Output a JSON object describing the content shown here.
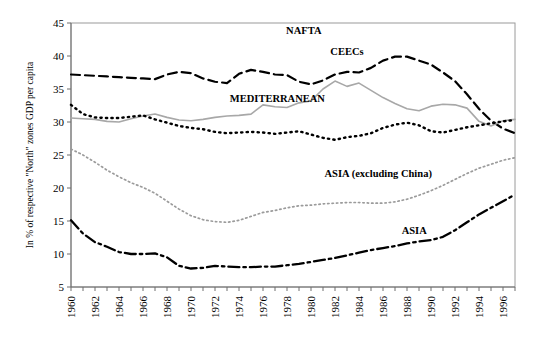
{
  "chart_data": {
    "type": "line",
    "title": "",
    "subtitle": "",
    "xlabel": "",
    "ylabel": "In % of respective \"North\" zones GDP per capita",
    "xlim": [
      1960,
      1997
    ],
    "ylim": [
      5,
      45
    ],
    "ytick_step": 5,
    "xtick_step": 1,
    "xtick_label_step": 2,
    "grid": false,
    "legend": "inline-annotations",
    "x": [
      1960,
      1961,
      1962,
      1963,
      1964,
      1965,
      1966,
      1967,
      1968,
      1969,
      1970,
      1971,
      1972,
      1973,
      1974,
      1975,
      1976,
      1977,
      1978,
      1979,
      1980,
      1981,
      1982,
      1983,
      1984,
      1985,
      1986,
      1987,
      1988,
      1989,
      1990,
      1991,
      1992,
      1993,
      1994,
      1995,
      1996,
      1997
    ],
    "ytick_labels": [
      "5",
      "10",
      "15",
      "20",
      "25",
      "30",
      "35",
      "40",
      "45"
    ],
    "xtick_labels": [
      "1960",
      "1962",
      "1964",
      "1966",
      "1968",
      "1970",
      "1972",
      "1974",
      "1976",
      "1978",
      "1980",
      "1982",
      "1984",
      "1986",
      "1988",
      "1990",
      "1992",
      "1994",
      "1996"
    ],
    "series": [
      {
        "name": "CEECs",
        "style": "dashed",
        "color": "#000000",
        "width": 2.2,
        "dash": "9,5",
        "label_x": 1983.0,
        "label_y": 40.2,
        "values": [
          37.2,
          37.1,
          37.0,
          36.9,
          36.8,
          36.7,
          36.6,
          36.5,
          37.2,
          37.6,
          37.4,
          36.6,
          36.1,
          35.9,
          37.3,
          37.9,
          37.6,
          37.2,
          37.1,
          36.1,
          35.7,
          36.3,
          37.2,
          37.6,
          37.5,
          38.2,
          39.3,
          39.9,
          39.9,
          39.3,
          38.7,
          37.5,
          36.2,
          34.2,
          32.0,
          30.2,
          29.0,
          28.3
        ]
      },
      {
        "name": "NAFTA",
        "style": "solid",
        "color": "#a8a8a8",
        "width": 1.6,
        "dash": "",
        "label_x": 1979.4,
        "label_y": 43.4,
        "values": [
          30.6,
          30.5,
          30.4,
          30.1,
          30.0,
          30.5,
          30.9,
          31.2,
          30.7,
          30.3,
          30.2,
          30.4,
          30.7,
          30.9,
          31.0,
          31.2,
          32.6,
          32.3,
          32.2,
          32.9,
          33.2,
          35.0,
          36.2,
          35.4,
          35.9,
          34.8,
          33.7,
          32.8,
          32.0,
          31.7,
          32.4,
          32.7,
          32.6,
          32.1,
          30.1,
          29.4,
          30.2,
          30.4
        ]
      },
      {
        "name": "MEDITERRANEAN",
        "style": "dotted",
        "color": "#000000",
        "width": 2.4,
        "dash": "1.3,4.2",
        "label_x": 1977.2,
        "label_y": 33.1,
        "values": [
          32.6,
          31.2,
          30.7,
          30.6,
          30.6,
          30.8,
          31.0,
          30.4,
          29.9,
          29.4,
          29.1,
          28.9,
          28.5,
          28.3,
          28.4,
          28.5,
          28.4,
          28.2,
          28.4,
          28.6,
          28.1,
          27.6,
          27.3,
          27.7,
          27.9,
          28.3,
          29.1,
          29.6,
          29.9,
          29.5,
          28.6,
          28.4,
          28.8,
          29.2,
          29.5,
          29.8,
          30.1,
          30.3
        ]
      },
      {
        "name": "ASIA (excluding China)",
        "style": "dotted",
        "color": "#9b9b9b",
        "width": 1.7,
        "dash": "1.4,3.0",
        "label_x": 1985.6,
        "label_y": 21.7,
        "values": [
          25.9,
          25.0,
          23.9,
          22.7,
          21.7,
          20.8,
          20.1,
          19.2,
          18.0,
          16.8,
          15.8,
          15.2,
          14.9,
          14.8,
          15.1,
          15.7,
          16.3,
          16.6,
          17.0,
          17.3,
          17.4,
          17.6,
          17.7,
          17.8,
          17.8,
          17.7,
          17.7,
          17.9,
          18.3,
          18.9,
          19.6,
          20.4,
          21.3,
          22.2,
          23.0,
          23.6,
          24.2,
          24.6
        ]
      },
      {
        "name": "ASIA",
        "style": "dashdot",
        "color": "#000000",
        "width": 2.3,
        "dash": "11,4,2.5,4",
        "label_x": 1988.6,
        "label_y": 13.0,
        "values": [
          15.1,
          13.1,
          11.8,
          11.1,
          10.3,
          10.0,
          10.0,
          10.1,
          9.5,
          8.2,
          7.8,
          7.9,
          8.2,
          8.1,
          8.0,
          8.0,
          8.1,
          8.1,
          8.3,
          8.5,
          8.8,
          9.1,
          9.4,
          9.8,
          10.2,
          10.6,
          10.9,
          11.2,
          11.6,
          11.9,
          12.1,
          12.6,
          13.6,
          14.8,
          16.0,
          17.0,
          18.0,
          19.0
        ]
      }
    ]
  }
}
